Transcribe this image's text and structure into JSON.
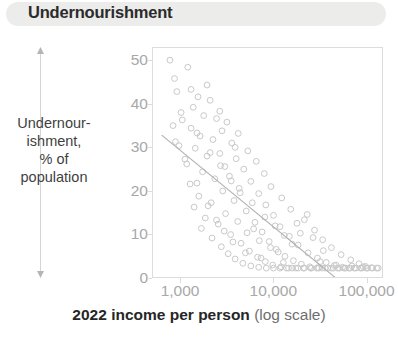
{
  "header": {
    "title": "Undernourishment"
  },
  "axes": {
    "y_label": "Undernour-\nishment,\n% of\npopulation",
    "x_title_bold": "2022 income per person",
    "x_title_muted": "(log scale)"
  },
  "colors": {
    "title_bar_background": "#ececeb",
    "title_text": "#2b2b2b",
    "tick_text": "#a8a8a8",
    "axis_line": "#dcdcdc",
    "point_stroke": "#c9c9c9",
    "trend_line": "#b0b0b0",
    "axis_label_text": "#3f3f3f"
  },
  "chart_data": {
    "type": "scatter",
    "title": "Undernourishment",
    "xlabel": "2022 income per person (log scale)",
    "ylabel": "Undernourishment, % of population",
    "xscale": "log",
    "xlim": [
      500,
      150000
    ],
    "ylim": [
      0,
      53
    ],
    "xticks": [
      1000,
      10000,
      100000
    ],
    "xtick_labels": [
      "1,000",
      "10,000",
      "100,000"
    ],
    "yticks": [
      0,
      10,
      20,
      30,
      40,
      50
    ],
    "ytick_labels": [
      "0",
      "10",
      "20",
      "30",
      "40",
      "50"
    ],
    "grid": false,
    "legend": "none",
    "marker": "open-circle",
    "trendline": {
      "type": "linear-in-log-x",
      "points": [
        [
          620,
          33.0
        ],
        [
          47000,
          0.0
        ]
      ]
    },
    "points": [
      [
        760,
        50.2
      ],
      [
        1180,
        48.6
      ],
      [
        900,
        43.0
      ],
      [
        1520,
        41.8
      ],
      [
        2050,
        41.0
      ],
      [
        1350,
        39.4
      ],
      [
        1000,
        38.2
      ],
      [
        1750,
        37.5
      ],
      [
        2400,
        36.8
      ],
      [
        3100,
        36.0
      ],
      [
        820,
        35.2
      ],
      [
        1280,
        34.6
      ],
      [
        2750,
        34.0
      ],
      [
        4100,
        33.4
      ],
      [
        1600,
        32.8
      ],
      [
        2200,
        32.0
      ],
      [
        3500,
        31.2
      ],
      [
        950,
        30.6
      ],
      [
        1420,
        30.0
      ],
      [
        5200,
        29.4
      ],
      [
        2600,
        28.8
      ],
      [
        1900,
        28.2
      ],
      [
        3900,
        27.6
      ],
      [
        6400,
        27.0
      ],
      [
        1150,
        26.4
      ],
      [
        2950,
        25.8
      ],
      [
        4700,
        25.2
      ],
      [
        1700,
        24.6
      ],
      [
        7800,
        24.2
      ],
      [
        3300,
        23.6
      ],
      [
        2300,
        23.0
      ],
      [
        5600,
        22.4
      ],
      [
        1250,
        21.8
      ],
      [
        9200,
        21.2
      ],
      [
        4200,
        20.8
      ],
      [
        2800,
        20.2
      ],
      [
        6800,
        19.6
      ],
      [
        1550,
        19.0
      ],
      [
        12000,
        18.6
      ],
      [
        3700,
        18.0
      ],
      [
        2100,
        17.5
      ],
      [
        8100,
        17.0
      ],
      [
        1380,
        16.5
      ],
      [
        15000,
        16.0
      ],
      [
        5000,
        15.6
      ],
      [
        3000,
        15.0
      ],
      [
        9800,
        14.6
      ],
      [
        1820,
        14.0
      ],
      [
        21000,
        13.6
      ],
      [
        6200,
        13.0
      ],
      [
        2500,
        12.6
      ],
      [
        11500,
        12.0
      ],
      [
        1650,
        11.6
      ],
      [
        27000,
        11.2
      ],
      [
        7400,
        10.8
      ],
      [
        3400,
        10.2
      ],
      [
        14500,
        9.8
      ],
      [
        2150,
        9.4
      ],
      [
        33000,
        9.0
      ],
      [
        8800,
        8.6
      ],
      [
        4400,
        8.2
      ],
      [
        18000,
        7.8
      ],
      [
        2700,
        7.4
      ],
      [
        41000,
        7.2
      ],
      [
        10500,
        6.8
      ],
      [
        5400,
        6.4
      ],
      [
        23000,
        6.0
      ],
      [
        3200,
        5.8
      ],
      [
        52000,
        5.6
      ],
      [
        13000,
        5.2
      ],
      [
        6600,
        5.0
      ],
      [
        29000,
        4.8
      ],
      [
        3800,
        4.6
      ],
      [
        66000,
        4.4
      ],
      [
        16000,
        4.2
      ],
      [
        8000,
        4.0
      ],
      [
        36000,
        3.8
      ],
      [
        4600,
        3.6
      ],
      [
        81000,
        3.5
      ],
      [
        19500,
        3.4
      ],
      [
        9600,
        3.2
      ],
      [
        44000,
        3.1
      ],
      [
        5600,
        3.0
      ],
      [
        95000,
        2.9
      ],
      [
        24000,
        2.8
      ],
      [
        11800,
        2.8
      ],
      [
        54000,
        2.7
      ],
      [
        6800,
        2.7
      ],
      [
        110000,
        2.6
      ],
      [
        29500,
        2.6
      ],
      [
        14200,
        2.5
      ],
      [
        63000,
        2.5
      ],
      [
        8200,
        2.5
      ],
      [
        125000,
        2.5
      ],
      [
        35000,
        2.5
      ],
      [
        17000,
        2.5
      ],
      [
        72000,
        2.5
      ],
      [
        9800,
        2.5
      ],
      [
        41000,
        2.5
      ],
      [
        20500,
        2.5
      ],
      [
        84000,
        2.5
      ],
      [
        11500,
        2.5
      ],
      [
        48000,
        2.5
      ],
      [
        24500,
        2.5
      ],
      [
        97000,
        2.5
      ],
      [
        13500,
        2.5
      ],
      [
        56000,
        2.5
      ],
      [
        28500,
        2.5
      ],
      [
        112000,
        2.5
      ],
      [
        15500,
        2.5
      ],
      [
        65000,
        2.5
      ],
      [
        32500,
        2.5
      ],
      [
        130000,
        2.5
      ],
      [
        18000,
        2.5
      ],
      [
        75000,
        2.5
      ],
      [
        37500,
        2.5
      ],
      [
        21000,
        2.5
      ],
      [
        87000,
        2.5
      ],
      [
        43000,
        2.5
      ],
      [
        25000,
        2.5
      ],
      [
        100000,
        2.5
      ],
      [
        50000,
        2.5
      ],
      [
        30000,
        2.5
      ],
      [
        58000,
        2.5
      ],
      [
        12500,
        3.8
      ],
      [
        7200,
        4.8
      ],
      [
        4900,
        6.0
      ],
      [
        3600,
        8.5
      ],
      [
        2900,
        11.0
      ],
      [
        2400,
        13.5
      ],
      [
        1950,
        16.8
      ],
      [
        1480,
        22.0
      ],
      [
        1100,
        27.5
      ],
      [
        870,
        31.5
      ],
      [
        6000,
        11.5
      ],
      [
        15500,
        8.0
      ],
      [
        22500,
        14.8
      ],
      [
        19000,
        10.5
      ],
      [
        26000,
        9.5
      ],
      [
        33500,
        6.5
      ],
      [
        17500,
        12.8
      ],
      [
        12800,
        10.0
      ],
      [
        10200,
        12.2
      ],
      [
        7900,
        14.2
      ],
      [
        5800,
        17.5
      ],
      [
        4300,
        19.8
      ],
      [
        3450,
        22.5
      ],
      [
        2650,
        26.0
      ],
      [
        2050,
        29.0
      ],
      [
        1480,
        33.5
      ],
      [
        1030,
        36.5
      ],
      [
        31000,
        4.0
      ],
      [
        46000,
        3.2
      ],
      [
        68000,
        3.0
      ],
      [
        90000,
        2.8
      ],
      [
        4050,
        13.2
      ],
      [
        5100,
        10.6
      ],
      [
        6900,
        8.8
      ],
      [
        9100,
        7.2
      ],
      [
        11000,
        6.2
      ],
      [
        1280,
        43.5
      ],
      [
        1900,
        44.5
      ],
      [
        2600,
        38.5
      ],
      [
        3800,
        30.2
      ],
      [
        850,
        46.0
      ]
    ]
  }
}
